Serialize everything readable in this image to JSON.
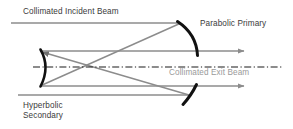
{
  "figure": {
    "width": 293,
    "height": 129,
    "background": "#ffffff"
  },
  "labels": {
    "incident_beam": "Collimated Incident Beam",
    "parabolic_primary": "Parabolic Primary",
    "exit_beam": "Collimated Exit Beam",
    "hyperbolic_secondary_line1": "Hyperbolic",
    "hyperbolic_secondary_line2": "Secondary"
  },
  "colors": {
    "ray": "#8c8c8c",
    "mirror": "#111111",
    "axis": "#1a1a1a",
    "text_dark": "#3b3b3b",
    "text_gray": "#9a9a9a",
    "background": "#ffffff"
  },
  "optics": {
    "optical_axis": {
      "name": "optical-axis",
      "style": "dash-dot",
      "y": 67,
      "x_start": 33,
      "x_end": 283
    },
    "mirrors": [
      {
        "name": "parabolic-primary-upper",
        "type": "parabolic",
        "path": "M 178 22 Q 196 34 197 55",
        "thickness": 3.0
      },
      {
        "name": "parabolic-primary-lower",
        "type": "parabolic",
        "path": "M 196 85 Q 190 95 183 104",
        "thickness": 3.0
      },
      {
        "name": "hyperbolic-secondary",
        "type": "hyperbolic",
        "path": "M 40 50 Q 50 67 40 86",
        "thickness": 2.6
      }
    ],
    "rays": [
      {
        "name": "incident-ray-upper",
        "x1": 11,
        "y1": 23,
        "x2": 181,
        "y2": 23,
        "arrow": false
      },
      {
        "name": "incident-ray-lower",
        "x1": 18,
        "y1": 95,
        "x2": 189,
        "y2": 95,
        "arrow": false
      },
      {
        "name": "converging-ray-upper",
        "x1": 181,
        "y1": 23,
        "x2": 40,
        "y2": 86,
        "arrow": false
      },
      {
        "name": "converging-ray-lower",
        "x1": 189,
        "y1": 95,
        "x2": 40,
        "y2": 51,
        "arrow": true
      },
      {
        "name": "exit-ray-upper",
        "x1": 40,
        "y1": 51,
        "x2": 250,
        "y2": 51,
        "arrow": true
      },
      {
        "name": "exit-ray-lower",
        "x1": 40,
        "y1": 86,
        "x2": 250,
        "y2": 86,
        "arrow": true
      }
    ]
  }
}
